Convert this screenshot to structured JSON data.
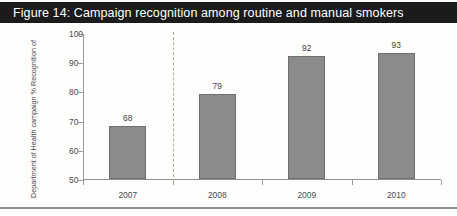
{
  "figure": {
    "title": "Figure 14: Campaign recognition among routine and manual smokers",
    "title_background": "#1b1b1b",
    "title_color": "#ffffff"
  },
  "chart_data": {
    "type": "bar",
    "title": "Figure 14: Campaign recognition among routine and manual smokers",
    "categories": [
      "2007",
      "2008",
      "2009",
      "2010"
    ],
    "values": [
      68,
      79,
      92,
      93
    ],
    "xlabel": "",
    "ylabel_line1": "% Recognition of",
    "ylabel_line2": "Department of Health campaign",
    "ylim": [
      50,
      100
    ],
    "yticks": [
      50,
      60,
      70,
      80,
      90,
      100
    ],
    "ytick_labels": [
      "50",
      "60",
      "70",
      "80",
      "90",
      "100"
    ],
    "grid": false,
    "legend": null,
    "bar_color": "#8b8b8b",
    "bar_border_color": "#6f6f6f",
    "annotations": [
      {
        "type": "vertical-dashed-line",
        "between": [
          "2007",
          "2008"
        ],
        "color": "#b4a79c"
      }
    ],
    "data_labels": [
      "68",
      "79",
      "92",
      "93"
    ]
  }
}
